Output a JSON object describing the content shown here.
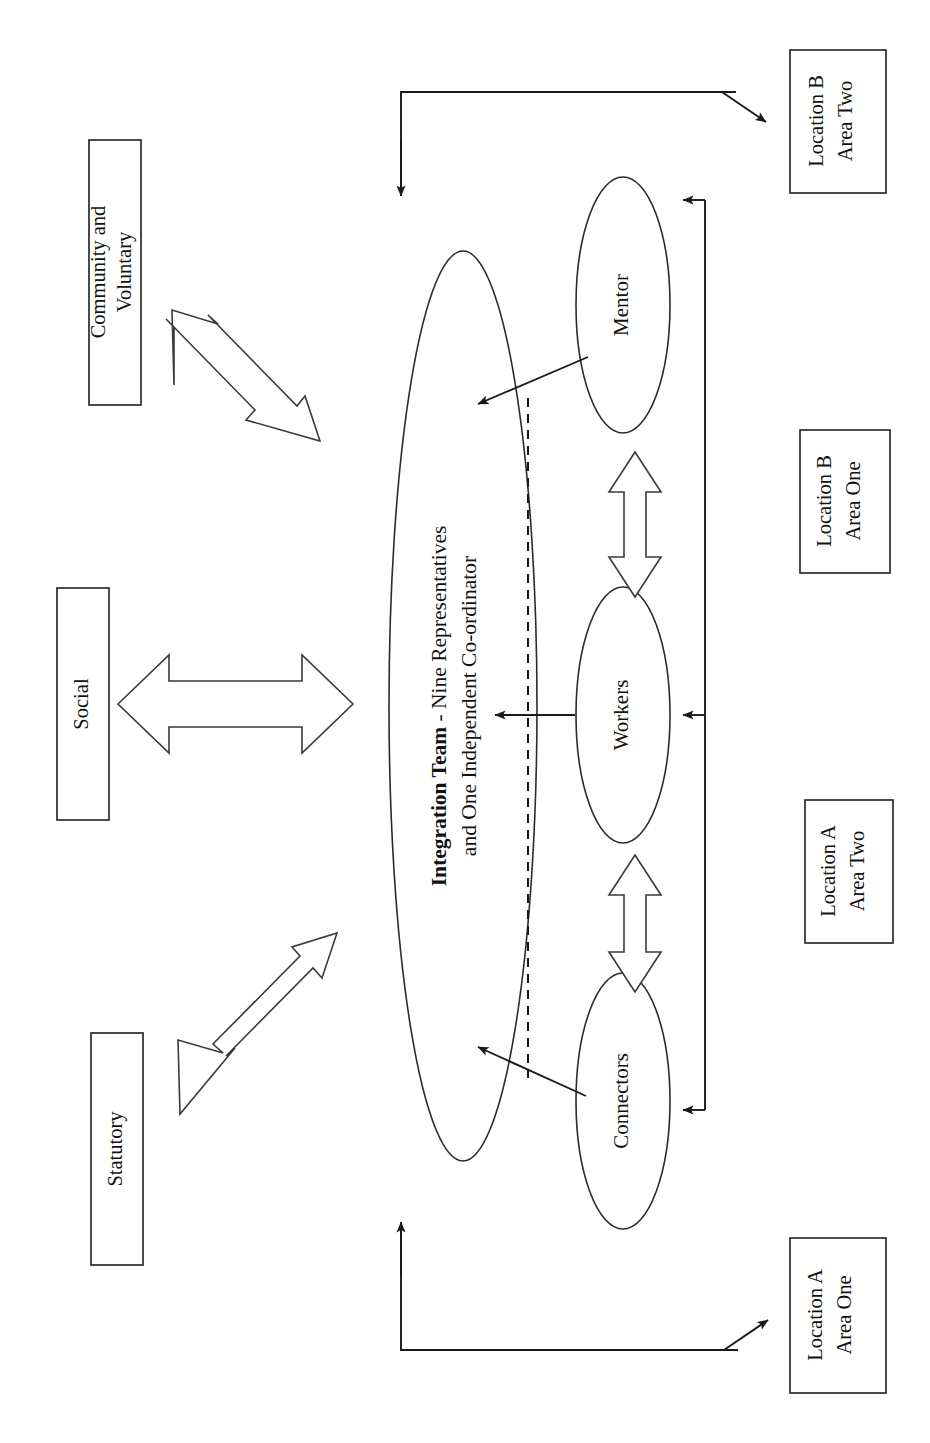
{
  "diagram": {
    "orientation": "rotated-90-landscape-on-portrait-page",
    "background_color": "#ffffff",
    "line_color": "#1a1a1a"
  },
  "center": {
    "name": "integration-team",
    "shape": "ellipse",
    "line1_bold": "Integration Team",
    "line1_rest": " -  Nine Representatives",
    "line2": "and One Independent Co-ordinator"
  },
  "roles": [
    {
      "id": "mentor",
      "label": "Mentor",
      "shape": "ellipse"
    },
    {
      "id": "workers",
      "label": "Workers",
      "shape": "ellipse"
    },
    {
      "id": "connectors",
      "label": "Connectors",
      "shape": "ellipse"
    }
  ],
  "sectors": [
    {
      "id": "community-and-voluntary",
      "line1": "Community and",
      "line2": "Voluntary"
    },
    {
      "id": "social",
      "line1": "Social",
      "line2": ""
    },
    {
      "id": "statutory",
      "line1": "Statutory",
      "line2": ""
    }
  ],
  "locations": [
    {
      "id": "location-b-area-two",
      "line1": "Location B",
      "line2": "Area Two"
    },
    {
      "id": "location-b-area-one",
      "line1": "Location B",
      "line2": "Area One"
    },
    {
      "id": "location-a-area-two",
      "line1": "Location A",
      "line2": "Area Two"
    },
    {
      "id": "location-a-area-one",
      "line1": "Location A",
      "line2": "Area One"
    }
  ],
  "connectors_meta": {
    "sector_arrows": "hollow double-headed diagonal and horizontal block arrows linking sectors to the Integration Team",
    "role_arrows": "hollow double-headed vertical block arrows linking Mentor, Workers and Connectors",
    "feed_arrows": "solid line arrows from roles into the Integration Team ellipse",
    "spine": "vertical line feeding Mentor, Workers and Connectors from the right",
    "dashed_divider": "dashed line separating the Integration Team from the role ellipses"
  }
}
